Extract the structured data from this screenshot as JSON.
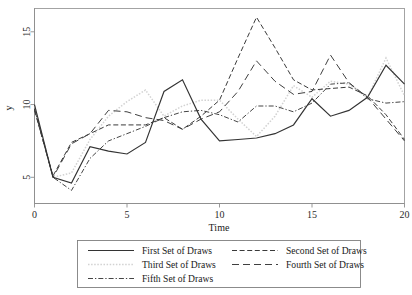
{
  "chart_data": {
    "type": "line",
    "title": "",
    "xlabel": "Time",
    "ylabel": "y",
    "xlim": [
      0,
      20
    ],
    "ylim": [
      3.2,
      16.6
    ],
    "xticks": [
      0,
      5,
      10,
      15,
      20
    ],
    "xticklabels": [
      "0",
      "5",
      "10",
      "15",
      "20"
    ],
    "yticks": [
      5,
      10,
      15
    ],
    "yticklabels": [
      "5",
      "10",
      "15"
    ],
    "grid": false,
    "legend_position": "below-axes",
    "x": [
      0,
      1,
      2,
      3,
      4,
      5,
      6,
      7,
      8,
      9,
      10,
      11,
      12,
      13,
      14,
      15,
      16,
      17,
      18,
      19,
      20
    ],
    "series": [
      {
        "name": "First Set of Draws",
        "style": "solid",
        "color": "#333333",
        "values": [
          10.0,
          5.0,
          4.6,
          7.1,
          6.8,
          6.6,
          7.4,
          10.9,
          11.7,
          9.0,
          7.5,
          7.6,
          7.7,
          8.0,
          8.6,
          10.4,
          9.2,
          9.6,
          10.5,
          12.7,
          11.4
        ]
      },
      {
        "name": "Second Set of Draws",
        "style": "dashed",
        "color": "#3a3a3a",
        "values": [
          9.6,
          5.1,
          7.4,
          8.0,
          8.6,
          8.6,
          8.6,
          9.1,
          8.3,
          9.2,
          10.3,
          13.2,
          16.0,
          13.9,
          11.7,
          11.0,
          11.1,
          11.2,
          10.6,
          9.3,
          7.6
        ]
      },
      {
        "name": "Third Set of Draws",
        "style": "dotted-light",
        "color": "#d2d2d2",
        "values": [
          9.9,
          5.0,
          5.3,
          7.6,
          9.2,
          10.2,
          11.0,
          9.2,
          9.9,
          10.3,
          10.3,
          9.0,
          7.8,
          9.2,
          11.3,
          10.5,
          11.6,
          11.4,
          10.5,
          13.2,
          10.6
        ]
      },
      {
        "name": "Fourth Set of Draws",
        "style": "long-dash",
        "color": "#3f3f3f",
        "values": [
          9.7,
          5.0,
          7.3,
          8.0,
          9.6,
          9.5,
          9.1,
          8.9,
          8.3,
          9.0,
          9.5,
          10.9,
          13.0,
          11.6,
          10.7,
          10.9,
          13.4,
          11.5,
          10.5,
          9.0,
          7.5
        ]
      },
      {
        "name": "Fifth Set of Draws",
        "style": "dash-dot",
        "color": "#454545",
        "values": [
          9.7,
          5.0,
          4.1,
          6.3,
          7.5,
          8.0,
          8.5,
          9.1,
          9.5,
          9.6,
          9.3,
          8.8,
          9.9,
          9.9,
          9.5,
          10.1,
          11.4,
          11.5,
          10.4,
          10.1,
          10.2
        ]
      }
    ]
  },
  "legend": {
    "entries": [
      {
        "label": "First Set of Draws",
        "style": "solid",
        "color": "#333333"
      },
      {
        "label": "Second Set of Draws",
        "style": "dashed",
        "color": "#3a3a3a"
      },
      {
        "label": "Third Set of Draws",
        "style": "dotted-light",
        "color": "#d2d2d2"
      },
      {
        "label": "Fourth Set of Draws",
        "style": "long-dash",
        "color": "#3f3f3f"
      },
      {
        "label": "Fifth Set of Draws",
        "style": "dash-dot",
        "color": "#454545"
      }
    ]
  }
}
